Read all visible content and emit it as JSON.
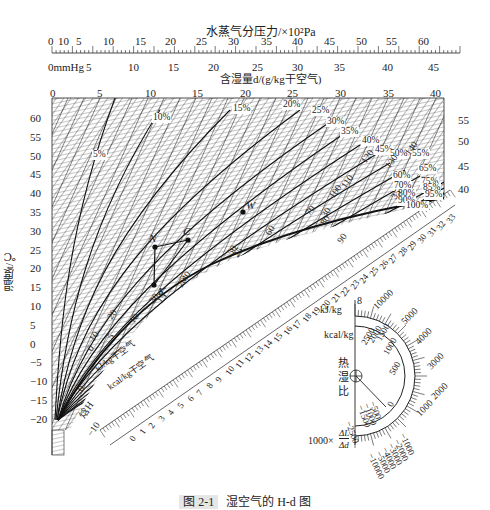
{
  "figure": {
    "caption_number": "图 2-1",
    "caption_text": "湿空气的 H-d 图"
  },
  "top_axis": {
    "pressure_title": "水蒸气分压力/×10²Pa",
    "pressure_ticks": [
      "0",
      "10",
      "5",
      "10",
      "15",
      "20",
      "25",
      "30",
      "35",
      "40",
      "45",
      "50",
      "55",
      "60"
    ],
    "mmhg_label": "0mmHg",
    "mmhg_ticks": [
      "5",
      "10",
      "15",
      "20",
      "25",
      "30",
      "35",
      "40",
      "45"
    ],
    "humidity_title": "含湿量d/(g/kg干空气)",
    "humidity_ticks": [
      "0",
      "5",
      "10",
      "15",
      "20",
      "25",
      "30",
      "35",
      "40"
    ]
  },
  "left_axis": {
    "title": "温度t/℃",
    "ticks": [
      "60",
      "55",
      "50",
      "45",
      "40",
      "35",
      "30",
      "25",
      "20",
      "15",
      "10",
      "5",
      "0",
      "−5",
      "−10",
      "−15",
      "−20"
    ]
  },
  "right_axis": {
    "ticks": [
      "55",
      "50",
      "45",
      "40"
    ]
  },
  "rh_labels": [
    "5%",
    "10%",
    "15%",
    "20%",
    "25%",
    "30%",
    "35%",
    "40%",
    "45%",
    "50%",
    "55%",
    "60%",
    "65%",
    "70%",
    "75%",
    "80%",
    "85%",
    "90%",
    "95%",
    "100%"
  ],
  "state_points": [
    {
      "name": "W"
    },
    {
      "name": "N"
    },
    {
      "name": "C"
    },
    {
      "name": "K"
    }
  ],
  "enthalpy_scale": {
    "title": "焓H",
    "kj_label": "kJ/kg干空气",
    "kcal_label": "kcal/kg干空气",
    "kj_ticks": [
      "−10",
      "0",
      "10",
      "20",
      "30",
      "40",
      "50",
      "60",
      "70",
      "80",
      "90",
      "100",
      "110",
      "120",
      "130",
      "140"
    ],
    "kcal_ticks": [
      "0",
      "1",
      "2",
      "3",
      "4",
      "5",
      "6",
      "7",
      "8",
      "9",
      "10",
      "11",
      "12",
      "13",
      "14",
      "15",
      "16",
      "17",
      "18",
      "19",
      "20",
      "21",
      "22",
      "23",
      "24",
      "25",
      "26",
      "27",
      "28",
      "29",
      "30",
      "31",
      "32",
      "33"
    ],
    "sat_temps": [
      "0",
      "5",
      "10",
      "15",
      "20",
      "25",
      "30",
      "35"
    ]
  },
  "heat_moisture_ratio": {
    "title_chars": [
      "热",
      "湿",
      "比"
    ],
    "kj_unit": "kJ/kg",
    "kcal_unit": "kcal/kg",
    "ratio_label": "1000×",
    "ratio_num": "ΔL",
    "ratio_den": "Δd",
    "top_value": "8",
    "outer_ticks": [
      "10000",
      "5000",
      "4000",
      "3000",
      "2000",
      "1000"
    ],
    "inner_ticks": [
      "2500",
      "2000",
      "1500",
      "1000",
      "500",
      "0"
    ],
    "neg_inner_ticks": [
      "−500",
      "−1000",
      "−1500",
      "−2500"
    ],
    "neg_outer_ticks": [
      "−1000",
      "−2000",
      "−3000",
      "−4000",
      "−5000",
      "−10000"
    ]
  },
  "chart_data": {
    "type": "line",
    "xlabel": "含湿量d/(g/kg干空气)",
    "ylabel": "温度t/℃",
    "xlim": [
      0,
      42
    ],
    "ylim": [
      -20,
      65
    ],
    "x_ticks": [
      0,
      5,
      10,
      15,
      20,
      25,
      30,
      35,
      40
    ],
    "y_ticks": [
      -20,
      -15,
      -10,
      -5,
      0,
      5,
      10,
      15,
      20,
      25,
      30,
      35,
      40,
      45,
      50,
      55,
      60
    ],
    "secondary_x_axes": [
      {
        "label": "水蒸气分压力/×10²Pa",
        "ticks": [
          0,
          5,
          10,
          15,
          20,
          25,
          30,
          35,
          40,
          45,
          50,
          55,
          60
        ]
      },
      {
        "label": "mmHg",
        "ticks": [
          0,
          5,
          10,
          15,
          20,
          25,
          30,
          35,
          40,
          45
        ]
      }
    ],
    "series": [
      {
        "name": "φ=5%",
        "points": [
          [
            0.3,
            -15
          ],
          [
            1.5,
            20
          ],
          [
            3.5,
            45
          ],
          [
            7,
            64
          ]
        ]
      },
      {
        "name": "φ=10%",
        "points": [
          [
            0.5,
            -15
          ],
          [
            2.5,
            20
          ],
          [
            6,
            45
          ],
          [
            12,
            60
          ]
        ]
      },
      {
        "name": "φ=15%",
        "points": [
          [
            0.6,
            -15
          ],
          [
            3.5,
            20
          ],
          [
            9,
            45
          ],
          [
            18,
            60
          ]
        ]
      },
      {
        "name": "φ=20%",
        "points": [
          [
            0.8,
            -15
          ],
          [
            4.5,
            20
          ],
          [
            12,
            45
          ],
          [
            24,
            60
          ]
        ]
      },
      {
        "name": "φ=40%",
        "points": [
          [
            1.0,
            -15
          ],
          [
            6,
            25
          ],
          [
            24,
            45
          ],
          [
            36,
            51
          ]
        ]
      },
      {
        "name": "φ=60%",
        "points": [
          [
            1.2,
            -15
          ],
          [
            8.5,
            25
          ],
          [
            30,
            42
          ],
          [
            38,
            45
          ]
        ]
      },
      {
        "name": "φ=80%",
        "points": [
          [
            1.3,
            -15
          ],
          [
            11,
            25
          ],
          [
            33,
            38
          ],
          [
            40,
            41
          ]
        ]
      },
      {
        "name": "φ=100%",
        "points": [
          [
            1.4,
            -15
          ],
          [
            3.8,
            0
          ],
          [
            7.6,
            10
          ],
          [
            14.7,
            20
          ],
          [
            27,
            30
          ],
          [
            37,
            35
          ]
        ]
      }
    ],
    "points": [
      {
        "name": "W",
        "d": 23,
        "t": 32
      },
      {
        "name": "N",
        "d": 10.5,
        "t": 25
      },
      {
        "name": "C",
        "d": 13.5,
        "t": 26
      },
      {
        "name": "K",
        "d": 10.5,
        "t": 14
      }
    ],
    "legend": "relative humidity curves labelled inline 5%–100%",
    "grid": true
  }
}
